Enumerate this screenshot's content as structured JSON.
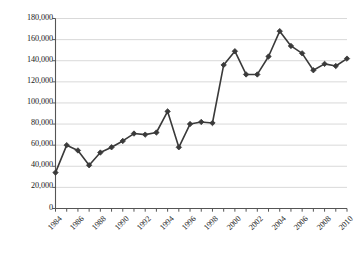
{
  "chart_data": {
    "type": "line",
    "title": "",
    "subtitle": "",
    "xlabel": "",
    "ylabel": "",
    "grid": true,
    "legend": false,
    "legend_position": "none",
    "marker": "diamond",
    "series_color": "#3a3a3a",
    "grid_color": "#c8c8c8",
    "axis_color": "#555555",
    "ylim": [
      0,
      180000
    ],
    "ytick_values": [
      0,
      20000,
      40000,
      60000,
      80000,
      100000,
      120000,
      140000,
      160000,
      180000
    ],
    "ytick_labels": [
      "0",
      "20,000",
      "40,000",
      "60,000",
      "80,000",
      "100,000",
      "120,000",
      "140,000",
      "160,000",
      "180,000"
    ],
    "xlim": [
      1984,
      2010
    ],
    "x": [
      1984,
      1985,
      1986,
      1987,
      1988,
      1989,
      1990,
      1991,
      1992,
      1993,
      1994,
      1995,
      1996,
      1997,
      1998,
      1999,
      2000,
      2001,
      2002,
      2003,
      2004,
      2005,
      2006,
      2007,
      2008,
      2009,
      2010
    ],
    "values": [
      34000,
      60000,
      55000,
      41000,
      53000,
      58000,
      64000,
      71000,
      70000,
      72000,
      92000,
      58000,
      80000,
      82000,
      81000,
      136000,
      149000,
      127000,
      127000,
      144000,
      168000,
      154000,
      147000,
      131000,
      137000,
      135000,
      142000
    ],
    "xtick_labels": [
      "1984",
      "1986",
      "1988",
      "1990",
      "1992",
      "1994",
      "1996",
      "1998",
      "2000",
      "2002",
      "2004",
      "2006",
      "2008",
      "2010"
    ],
    "xtick_values": [
      1984,
      1986,
      1988,
      1990,
      1992,
      1994,
      1996,
      1998,
      2000,
      2002,
      2004,
      2006,
      2008,
      2010
    ],
    "xminor_values": [
      1984,
      1985,
      1986,
      1987,
      1988,
      1989,
      1990,
      1991,
      1992,
      1993,
      1994,
      1995,
      1996,
      1997,
      1998,
      1999,
      2000,
      2001,
      2002,
      2003,
      2004,
      2005,
      2006,
      2007,
      2008,
      2009,
      2010
    ]
  }
}
